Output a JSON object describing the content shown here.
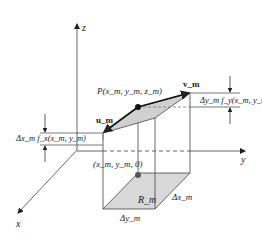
{
  "figure": {
    "axes": {
      "x_label": "x",
      "y_label": "y",
      "z_label": "z"
    },
    "labels": {
      "point_P": "P(x_m, y_m, z_m)",
      "vector_u": "u_m",
      "vector_v": "v_m",
      "delta_y_term": "Δy_m f_y(x_m, y_m)",
      "delta_x_term": "Δx_m f_x(x_m, y_m)",
      "base_point": "(x_m, y_m, 0)",
      "region": "R_m",
      "delta_x": "Δx_m",
      "delta_y": "Δy_m"
    },
    "colors": {
      "line": "#333333",
      "axis": "#555555",
      "fill_plane": "#d0d0d0",
      "fill_region": "#d8d8d8",
      "point": "#111111",
      "base_point": "#555555"
    }
  }
}
